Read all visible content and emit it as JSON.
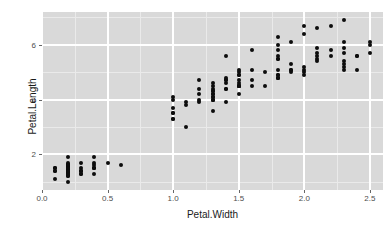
{
  "chart_data": {
    "type": "scatter",
    "title": "",
    "xlabel": "Petal.Width",
    "ylabel": "Petal.Length",
    "xlim": [
      0.0,
      2.6
    ],
    "ylim": [
      0.7,
      7.2
    ],
    "xticks": [
      "0.0",
      "0.5",
      "1.0",
      "1.5",
      "2.0",
      "2.5"
    ],
    "xtick_values": [
      0.0,
      0.5,
      1.0,
      1.5,
      2.0,
      2.5
    ],
    "yticks": [
      "2",
      "4",
      "6"
    ],
    "ytick_values": [
      2,
      4,
      6
    ],
    "x_minor_values": [
      0.25,
      0.75,
      1.25,
      1.75,
      2.25
    ],
    "y_minor_values": [
      1,
      3,
      5,
      7
    ],
    "grid": true,
    "legend": "none",
    "point_color": "#0d0d0d",
    "point_size": 4,
    "panel_background": "#d9d9d9",
    "grid_major_color": "#ffffff",
    "grid_minor_color": "#eaeaea",
    "axis_text_color": "#4d4d4d",
    "axis_title_color": "#1a1a1a",
    "series_name": "iris",
    "x": [
      0.2,
      0.2,
      0.2,
      0.2,
      0.2,
      0.4,
      0.3,
      0.2,
      0.2,
      0.1,
      0.2,
      0.2,
      0.1,
      0.1,
      0.2,
      0.4,
      0.4,
      0.3,
      0.3,
      0.3,
      0.2,
      0.4,
      0.2,
      0.5,
      0.2,
      0.2,
      0.4,
      0.2,
      0.2,
      0.2,
      0.2,
      0.4,
      0.1,
      0.2,
      0.2,
      0.2,
      0.2,
      0.1,
      0.2,
      0.2,
      0.3,
      0.3,
      0.2,
      0.6,
      0.4,
      0.3,
      0.2,
      0.2,
      0.2,
      0.2,
      1.4,
      1.5,
      1.5,
      1.3,
      1.5,
      1.3,
      1.6,
      1.0,
      1.3,
      1.4,
      1.0,
      1.5,
      1.0,
      1.4,
      1.3,
      1.4,
      1.5,
      1.0,
      1.5,
      1.1,
      1.8,
      1.3,
      1.5,
      1.2,
      1.3,
      1.4,
      1.4,
      1.7,
      1.5,
      1.0,
      1.1,
      1.0,
      1.2,
      1.6,
      1.5,
      1.6,
      1.5,
      1.3,
      1.3,
      1.3,
      1.2,
      1.4,
      1.2,
      1.0,
      1.3,
      1.2,
      1.3,
      1.3,
      1.1,
      1.3,
      2.5,
      1.9,
      2.1,
      1.8,
      2.2,
      2.1,
      1.7,
      1.8,
      1.8,
      2.5,
      2.0,
      1.9,
      2.1,
      2.0,
      2.4,
      2.3,
      1.8,
      2.2,
      2.3,
      1.5,
      2.3,
      2.0,
      2.0,
      1.8,
      2.1,
      1.8,
      1.8,
      1.8,
      2.1,
      1.6,
      1.9,
      2.0,
      2.2,
      1.5,
      1.4,
      2.3,
      2.4,
      1.8,
      1.8,
      2.1,
      2.4,
      2.3,
      1.9,
      2.3,
      2.5,
      2.3,
      1.9,
      2.0,
      2.3,
      1.8
    ],
    "y": [
      1.4,
      1.4,
      1.3,
      1.5,
      1.4,
      1.7,
      1.4,
      1.5,
      1.4,
      1.5,
      1.5,
      1.6,
      1.4,
      1.1,
      1.2,
      1.5,
      1.3,
      1.4,
      1.7,
      1.5,
      1.7,
      1.5,
      1.0,
      1.7,
      1.9,
      1.6,
      1.6,
      1.5,
      1.4,
      1.6,
      1.6,
      1.5,
      1.5,
      1.4,
      1.5,
      1.2,
      1.3,
      1.4,
      1.3,
      1.5,
      1.3,
      1.3,
      1.3,
      1.6,
      1.9,
      1.4,
      1.6,
      1.4,
      1.5,
      1.4,
      4.7,
      4.5,
      4.9,
      4.0,
      4.6,
      4.5,
      4.7,
      3.3,
      4.6,
      3.9,
      3.5,
      4.2,
      4.0,
      4.7,
      3.6,
      4.4,
      4.5,
      4.1,
      4.5,
      3.9,
      4.8,
      4.0,
      4.9,
      4.7,
      4.3,
      4.4,
      4.8,
      5.0,
      4.5,
      3.5,
      3.8,
      3.7,
      3.9,
      5.1,
      4.5,
      4.5,
      4.7,
      4.4,
      4.1,
      4.0,
      4.4,
      4.6,
      4.0,
      3.3,
      4.2,
      4.2,
      4.2,
      4.3,
      3.0,
      4.1,
      6.0,
      5.1,
      5.9,
      5.6,
      5.8,
      6.6,
      4.5,
      6.3,
      5.8,
      6.1,
      5.1,
      5.3,
      5.5,
      5.0,
      5.1,
      5.3,
      5.5,
      6.7,
      6.9,
      5.0,
      5.7,
      4.9,
      6.7,
      4.9,
      5.7,
      6.0,
      4.8,
      4.9,
      5.6,
      5.8,
      6.1,
      6.4,
      5.6,
      5.1,
      5.6,
      6.1,
      5.6,
      5.5,
      4.8,
      5.4,
      5.6,
      5.1,
      5.1,
      5.9,
      5.7,
      5.2,
      5.0,
      5.2,
      5.4,
      5.1
    ]
  }
}
